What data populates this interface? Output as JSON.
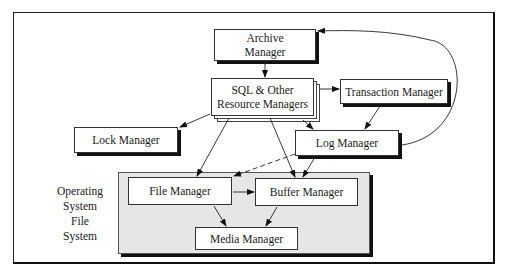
{
  "diagram": {
    "type": "architecture",
    "nodes": {
      "archive_manager": {
        "line1": "Archive",
        "line2": "Manager"
      },
      "sql_resource_managers": {
        "line1": "SQL & Other",
        "line2": "Resource Managers"
      },
      "transaction_manager": {
        "label": "Transaction Manager"
      },
      "lock_manager": {
        "label": "Lock Manager"
      },
      "log_manager": {
        "label": "Log Manager"
      },
      "file_manager": {
        "label": "File Manager"
      },
      "buffer_manager": {
        "label": "Buffer Manager"
      },
      "media_manager": {
        "label": "Media Manager"
      }
    },
    "group_label": {
      "line1": "Operating",
      "line2": "System",
      "line3": "File",
      "line4": "System"
    },
    "edges": [
      {
        "from": "Archive Manager",
        "to": "SQL & Other Resource Managers",
        "style": "solid"
      },
      {
        "from": "SQL & Other Resource Managers",
        "to": "Transaction Manager",
        "style": "solid"
      },
      {
        "from": "SQL & Other Resource Managers",
        "to": "Lock Manager",
        "style": "solid"
      },
      {
        "from": "SQL & Other Resource Managers",
        "to": "Log Manager",
        "style": "solid"
      },
      {
        "from": "SQL & Other Resource Managers",
        "to": "File Manager",
        "style": "solid"
      },
      {
        "from": "SQL & Other Resource Managers",
        "to": "Buffer Manager",
        "style": "solid"
      },
      {
        "from": "Transaction Manager",
        "to": "Log Manager",
        "style": "solid"
      },
      {
        "from": "Log Manager",
        "to": "Archive Manager",
        "style": "curved"
      },
      {
        "from": "Log Manager",
        "to": "File Manager",
        "style": "dashed"
      },
      {
        "from": "Log Manager",
        "to": "Buffer Manager",
        "style": "solid"
      },
      {
        "from": "File Manager",
        "to": "Buffer Manager",
        "style": "solid"
      },
      {
        "from": "File Manager",
        "to": "Media Manager",
        "style": "solid"
      },
      {
        "from": "Buffer Manager",
        "to": "Media Manager",
        "style": "solid"
      }
    ],
    "colors": {
      "region_fill": "#e6e6e6",
      "line": "#222222",
      "shadow": "#111111"
    }
  }
}
